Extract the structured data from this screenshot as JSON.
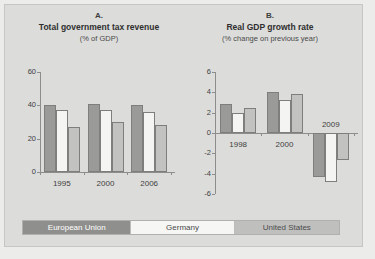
{
  "chart_data": [
    {
      "type": "bar",
      "panel": "A.",
      "title": "Total government tax revenue",
      "subtitle": "(% of GDP)",
      "xlabel": "",
      "ylabel": "",
      "ylim": [
        0,
        60
      ],
      "yticks": [
        0,
        20,
        40,
        60
      ],
      "ytick_labels": [
        "0",
        "20",
        "40",
        "60"
      ],
      "grid": false,
      "legend_position": "bottom",
      "categories": [
        "1995",
        "2000",
        "2006"
      ],
      "series": [
        {
          "name": "European Union",
          "values": [
            40,
            41,
            40.5
          ]
        },
        {
          "name": "Germany",
          "values": [
            37,
            37.5,
            36
          ]
        },
        {
          "name": "United States",
          "values": [
            27,
            30,
            28
          ]
        }
      ]
    },
    {
      "type": "bar",
      "panel": "B.",
      "title": "Real GDP growth rate",
      "subtitle": "(% change on previous year)",
      "xlabel": "",
      "ylabel": "",
      "ylim": [
        -6,
        6
      ],
      "yticks": [
        -6,
        -4,
        -2,
        0,
        2,
        4,
        6
      ],
      "ytick_labels": [
        "-6",
        "-4",
        "-2",
        "0",
        "2",
        "4",
        "6"
      ],
      "grid": false,
      "legend_position": "bottom",
      "categories": [
        "1998",
        "2000",
        "2009"
      ],
      "series": [
        {
          "name": "European Union",
          "values": [
            2.9,
            4.0,
            -4.3
          ]
        },
        {
          "name": "Germany",
          "values": [
            2.0,
            3.2,
            -4.8
          ]
        },
        {
          "name": "United States",
          "values": [
            2.5,
            3.8,
            -2.7
          ]
        }
      ],
      "annotations": [
        {
          "text": "2009",
          "category": "2009"
        }
      ]
    }
  ],
  "legend": {
    "items": [
      {
        "label": "European Union",
        "color": "#8f8f8d"
      },
      {
        "label": "Germany",
        "color": "#f6f6f4"
      },
      {
        "label": "United States",
        "color": "#bfbfbd"
      }
    ]
  },
  "colors": {
    "european_union": "#9a9a98",
    "germany": "#f4f4f2",
    "united_states": "#c2c2c0",
    "panel_background": "#dcdcda",
    "page_background": "#ececeb",
    "axis": "#8d8d8b",
    "text": "#3f3f3f"
  }
}
